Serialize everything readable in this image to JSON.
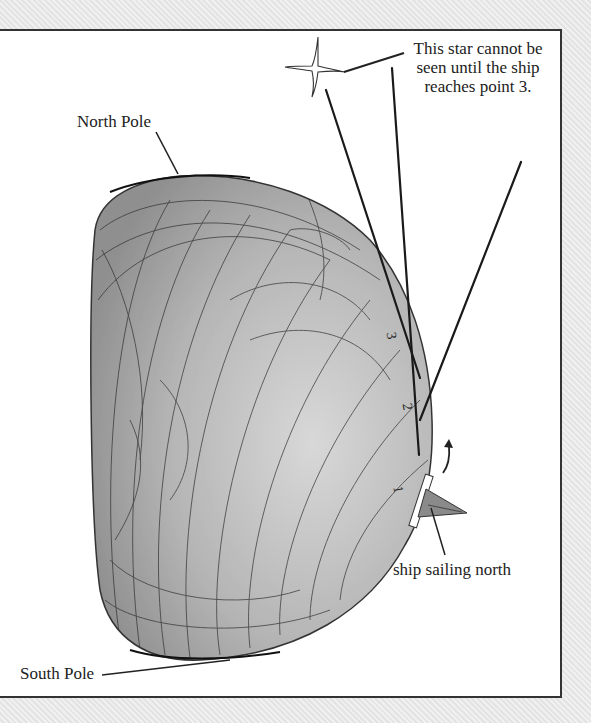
{
  "diagram": {
    "labels": {
      "star_note": "This star cannot be seen until the ship reaches point 3.",
      "north_pole": "North Pole",
      "south_pole": "South Pole",
      "ship": "ship sailing north"
    },
    "points": [
      "1",
      "2",
      "3"
    ],
    "icons": {
      "star": "four-point-star",
      "ship": "sailing-ship",
      "arrow": "curved-arrow-up"
    },
    "colors": {
      "frame_border": "#333333",
      "globe_fill": "#a9a9a9",
      "ink": "#222222",
      "background": "#e8e8e8"
    }
  }
}
